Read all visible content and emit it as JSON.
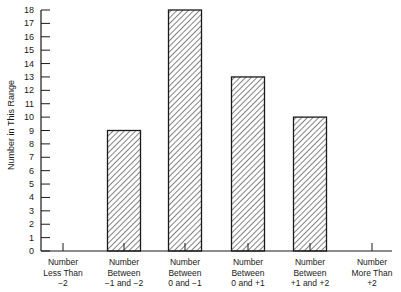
{
  "chart_data": {
    "type": "bar",
    "title": "",
    "xlabel": "",
    "ylabel": "Number in This Range",
    "ylim": [
      0,
      18
    ],
    "yticks": [
      0,
      1,
      2,
      3,
      4,
      5,
      6,
      7,
      8,
      9,
      10,
      11,
      12,
      13,
      14,
      15,
      16,
      17,
      18
    ],
    "grid": false,
    "legend": null,
    "bar_fill": "diagonal hatch",
    "categories": [
      "Number Less Than −2",
      "Number Between −1 and −2",
      "Number Between 0 and −1",
      "Number Between 0 and +1",
      "Number Between +1 and +2",
      "Number More Than +2"
    ],
    "category_lines": [
      [
        "Number",
        "Less Than",
        "−2"
      ],
      [
        "Number",
        "Between",
        "−1 and −2"
      ],
      [
        "Number",
        "Between",
        "0 and −1"
      ],
      [
        "Number",
        "Between",
        "0 and +1"
      ],
      [
        "Number",
        "Between",
        "+1 and +2"
      ],
      [
        "Number",
        "More Than",
        "+2"
      ]
    ],
    "values": [
      0,
      9,
      18,
      13,
      10,
      0
    ]
  },
  "colors": {
    "ink": "#1a1a1a",
    "background": "#ffffff"
  }
}
